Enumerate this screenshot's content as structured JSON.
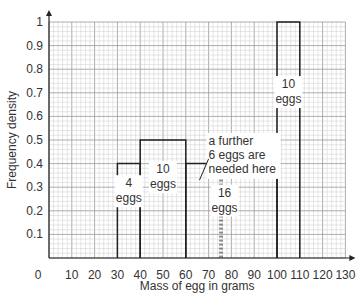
{
  "chart_data": {
    "type": "bar",
    "title": "",
    "xlabel": "Mass of egg in grams",
    "ylabel": "Frequency density",
    "xlim": [
      0,
      130
    ],
    "ylim": [
      0,
      1
    ],
    "x_ticks": [
      0,
      10,
      20,
      30,
      40,
      50,
      60,
      70,
      80,
      90,
      100,
      110,
      120,
      130
    ],
    "y_ticks": [
      0.1,
      0.2,
      0.3,
      0.4,
      0.5,
      0.6,
      0.7,
      0.8,
      0.9,
      1
    ],
    "grid": true,
    "bars": [
      {
        "x0": 30,
        "x1": 40,
        "height": 0.4,
        "label": [
          "4",
          "eggs"
        ]
      },
      {
        "x0": 40,
        "x1": 60,
        "height": 0.5,
        "label": [
          "10",
          "eggs"
        ]
      },
      {
        "x0": 60,
        "x1": 100,
        "height": 0.4,
        "label": [
          "16",
          "eggs"
        ]
      },
      {
        "x0": 100,
        "x1": 110,
        "height": 1.0,
        "label": [
          "10",
          "eggs"
        ]
      }
    ],
    "annotations": [
      {
        "text": [
          "a further",
          "6 eggs are",
          "needed here"
        ],
        "x": 65,
        "y": 0.38
      }
    ],
    "dashed_line_x": 75
  }
}
